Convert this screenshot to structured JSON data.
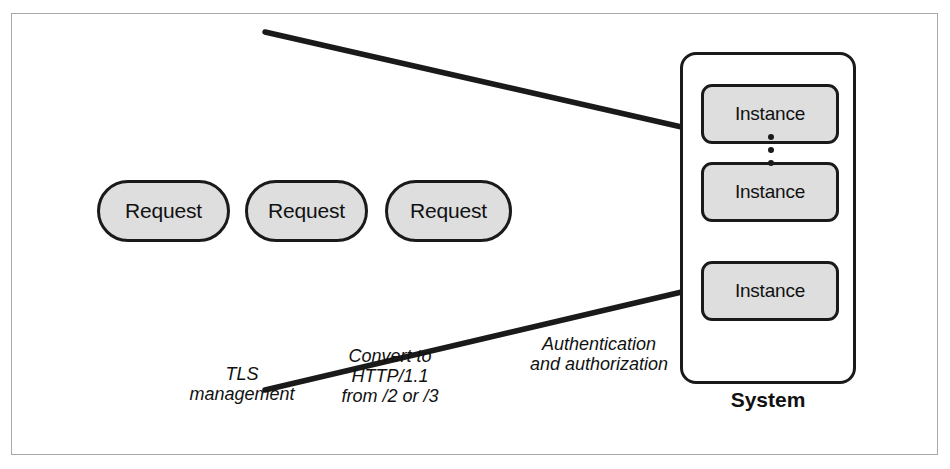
{
  "figure": {
    "name": "load-balancer-reverse-proxy-diagram",
    "border_color": "#a9a9a9",
    "background": "#ffffff",
    "stroke_color": "#1a1a1a",
    "shape_fill": "#dedede"
  },
  "requests": [
    {
      "label": "Request"
    },
    {
      "label": "Request"
    },
    {
      "label": "Request"
    }
  ],
  "system": {
    "label": "System",
    "instances": [
      {
        "label": "Instance"
      },
      {
        "label": "Instance"
      },
      {
        "label": "Instance"
      }
    ],
    "ellipsis": "⋮"
  },
  "annotations": [
    {
      "id": "tls",
      "text": "TLS\nmanagement"
    },
    {
      "id": "convert",
      "text": "Convert to\nHTTP/1.1\nfrom /2 or /3"
    },
    {
      "id": "authn",
      "text": "Authentication\nand authorization"
    }
  ],
  "funnel_lines": [
    {
      "id": "upper",
      "x1": 265,
      "y1": 32,
      "x2": 686,
      "y2": 128
    },
    {
      "id": "lower",
      "x1": 265,
      "y1": 390,
      "x2": 686,
      "y2": 291
    }
  ]
}
